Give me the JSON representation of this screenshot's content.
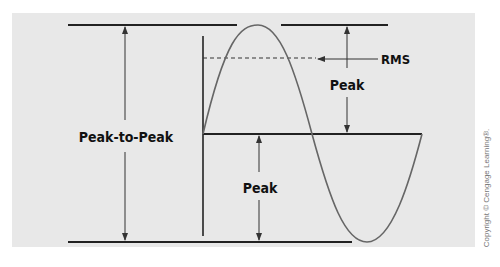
{
  "diagram": {
    "labels": {
      "peak_to_peak": "Peak-to-Peak",
      "peak_upper": "Peak",
      "peak_lower": "Peak",
      "rms": "RMS"
    },
    "copyright": "Copyright © Cengage Learning®."
  },
  "colors": {
    "panel_bg": "#e8e8e8",
    "line": "#222222",
    "wave": "#666666"
  }
}
